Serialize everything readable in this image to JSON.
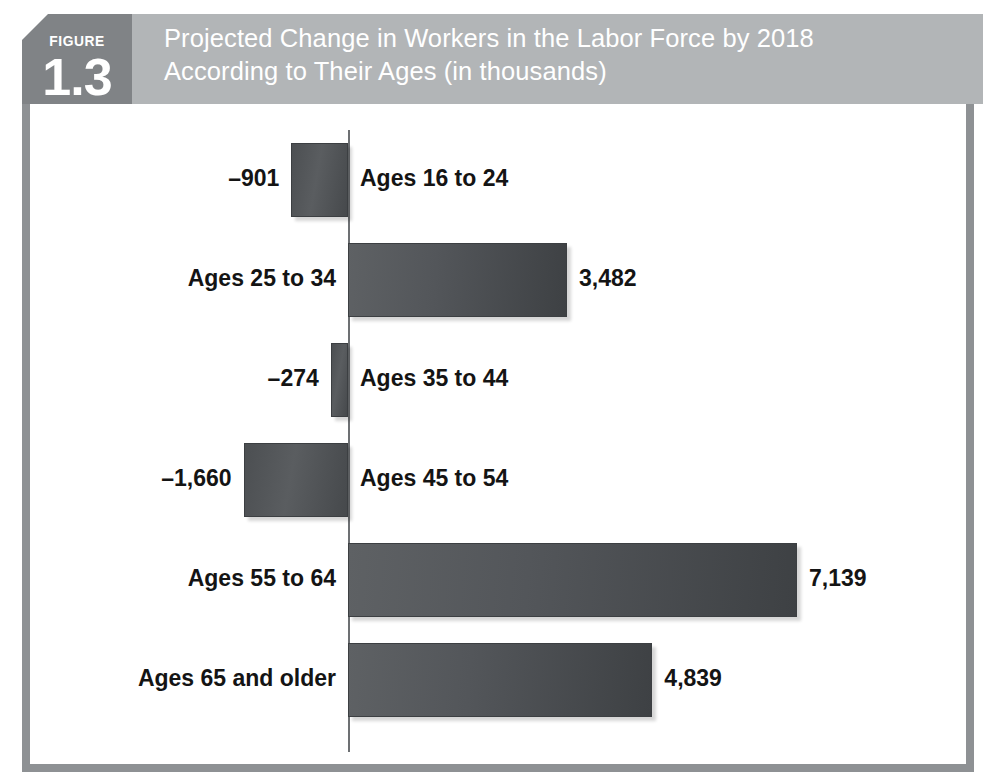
{
  "figure": {
    "badge_word": "FIGURE",
    "badge_number": "1.3",
    "title": "Projected Change in Workers in the Labor Force by 2018\nAccording to Their Ages (in thousands)"
  },
  "colors": {
    "header_band": "#b2b5b7",
    "badge": "#808386",
    "frame": "#8e9194",
    "bar_dark": "#4c4f52",
    "axis": "#6d7073",
    "text": "#141414",
    "title_text": "#ffffff"
  },
  "chart_data": {
    "type": "bar",
    "orientation": "horizontal",
    "title": "Projected Change in Workers in the Labor Force by 2018 According to Their Ages (in thousands)",
    "xlabel": "",
    "ylabel": "",
    "units": "thousands",
    "grid": false,
    "legend": "none",
    "axis_origin": 0,
    "xlim": [
      -1660,
      7139
    ],
    "categories": [
      "Ages 16 to 24",
      "Ages 25 to 34",
      "Ages 35 to 44",
      "Ages 45 to 54",
      "Ages 55 to 64",
      "Ages 65 and older"
    ],
    "values": [
      -901,
      3482,
      -274,
      -1660,
      7139,
      4839
    ],
    "value_labels": [
      "–901",
      "3,482",
      "–274",
      "–1,660",
      "7,139",
      "4,839"
    ],
    "bars": [
      {
        "category": "Ages 16 to 24",
        "value": -901,
        "value_label": "–901",
        "label": "Ages 16 to 24",
        "sign": "neg"
      },
      {
        "category": "Ages 25 to 34",
        "value": 3482,
        "value_label": "3,482",
        "label": "Ages 25 to 34",
        "sign": "pos"
      },
      {
        "category": "Ages 35 to 44",
        "value": -274,
        "value_label": "–274",
        "label": "Ages 35 to 44",
        "sign": "neg"
      },
      {
        "category": "Ages 45 to 54",
        "value": -1660,
        "value_label": "–1,660",
        "label": "Ages 45 to 54",
        "sign": "neg"
      },
      {
        "category": "Ages 55 to 64",
        "value": 7139,
        "value_label": "7,139",
        "label": "Ages 55 to 64",
        "sign": "pos"
      },
      {
        "category": "Ages 65 and older",
        "value": 4839,
        "value_label": "4,839",
        "label": "Ages 65 and older",
        "sign": "pos"
      }
    ]
  }
}
